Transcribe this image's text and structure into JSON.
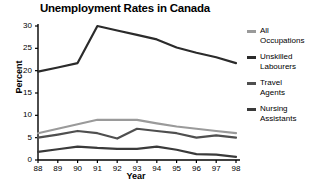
{
  "chart_data": {
    "type": "line",
    "title": "Unemployment Rates in Canada",
    "xlabel": "Year",
    "ylabel": "Percent",
    "x": [
      "88",
      "89",
      "90",
      "91",
      "92",
      "93",
      "94",
      "95",
      "96",
      "97",
      "98"
    ],
    "xlim": [
      87.5,
      98.5
    ],
    "ylim": [
      0,
      30
    ],
    "yticks": [
      0,
      5,
      10,
      15,
      20,
      25,
      30
    ],
    "ytick_labels": [
      "0",
      "5",
      "10",
      "15",
      "20",
      "25",
      "30"
    ],
    "grid": false,
    "legend_position": "right",
    "series": [
      {
        "name": "All Occupations",
        "label": "All\nOccupations",
        "color": "#9a9a9a",
        "values": [
          6.0,
          7.0,
          8.0,
          9.0,
          9.0,
          9.0,
          8.2,
          7.5,
          7.0,
          6.5,
          6.0
        ]
      },
      {
        "name": "Unskilled Labourers",
        "label": "Unskilled\nLabourers",
        "color": "#2b2b2b",
        "values": [
          19.8,
          20.7,
          21.7,
          30.0,
          29.0,
          28.0,
          27.0,
          25.2,
          24.0,
          23.0,
          21.7
        ]
      },
      {
        "name": "Travel Agents",
        "label": "Travel\nAgents",
        "color": "#4f4f4f",
        "values": [
          5.0,
          5.7,
          6.5,
          6.0,
          4.8,
          7.0,
          6.5,
          6.0,
          5.0,
          5.5,
          5.0
        ]
      },
      {
        "name": "Nursing Assistants",
        "label": "Nursing\nAssistants",
        "color": "#3a3a3a",
        "values": [
          1.8,
          2.4,
          3.0,
          2.7,
          2.5,
          2.5,
          3.0,
          2.3,
          1.3,
          1.2,
          0.7
        ]
      }
    ]
  }
}
